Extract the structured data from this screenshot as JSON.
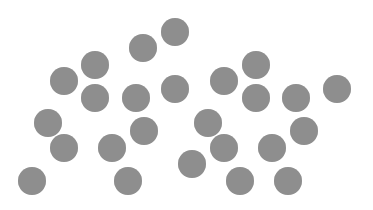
{
  "canvas": {
    "width": 373,
    "height": 210,
    "background": "#ffffff"
  },
  "dot_style": {
    "radius": 14,
    "fill": "#8e8e8e"
  },
  "dots": [
    {
      "x": 175,
      "y": 32
    },
    {
      "x": 143,
      "y": 48
    },
    {
      "x": 95,
      "y": 65
    },
    {
      "x": 64,
      "y": 81
    },
    {
      "x": 95,
      "y": 98
    },
    {
      "x": 136,
      "y": 98
    },
    {
      "x": 175,
      "y": 89
    },
    {
      "x": 224,
      "y": 81
    },
    {
      "x": 256,
      "y": 65
    },
    {
      "x": 256,
      "y": 98
    },
    {
      "x": 296,
      "y": 98
    },
    {
      "x": 337,
      "y": 89
    },
    {
      "x": 48,
      "y": 123
    },
    {
      "x": 64,
      "y": 148
    },
    {
      "x": 144,
      "y": 131
    },
    {
      "x": 112,
      "y": 148
    },
    {
      "x": 128,
      "y": 181
    },
    {
      "x": 32,
      "y": 181
    },
    {
      "x": 208,
      "y": 123
    },
    {
      "x": 224,
      "y": 148
    },
    {
      "x": 192,
      "y": 164
    },
    {
      "x": 240,
      "y": 181
    },
    {
      "x": 304,
      "y": 131
    },
    {
      "x": 272,
      "y": 148
    },
    {
      "x": 288,
      "y": 181
    }
  ],
  "dot_count": 25
}
